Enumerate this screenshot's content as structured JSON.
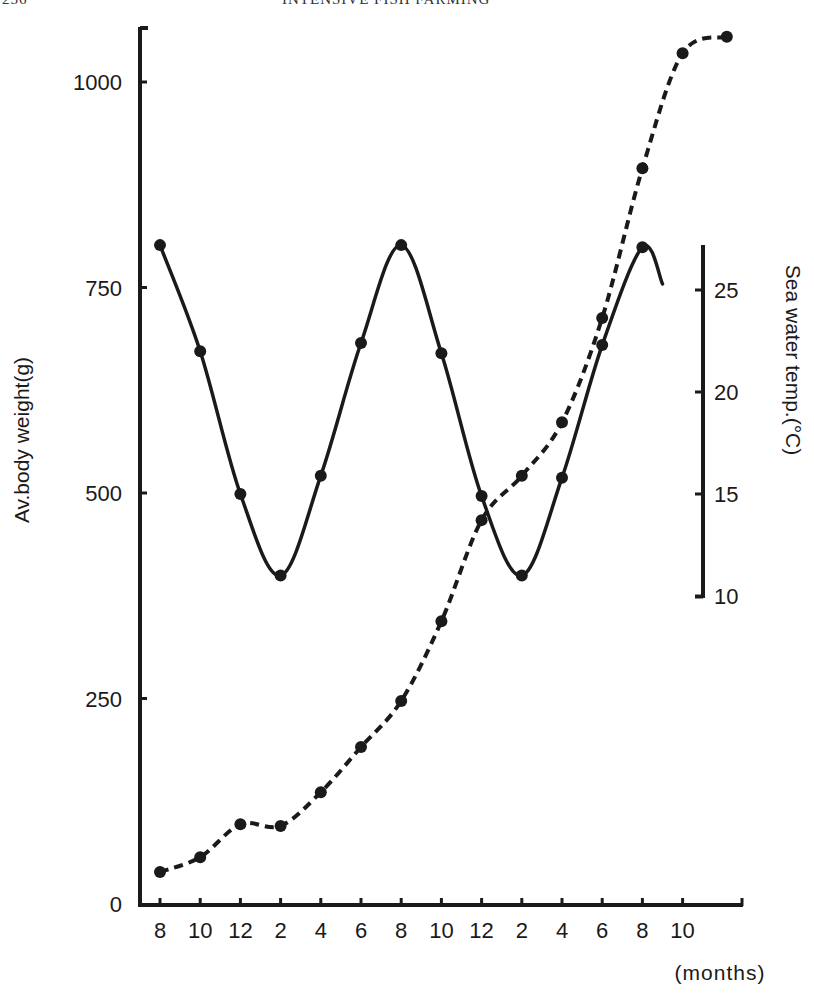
{
  "page": {
    "number": "256",
    "running_title": "INTENSIVE FISH FARMING"
  },
  "chart_data": {
    "type": "line",
    "title": "",
    "xlabel": "(months)",
    "ylabel": "Av.body weight(g)",
    "y2label": "Sea water temp.(°C)",
    "x_tick_labels": [
      "8",
      "10",
      "12",
      "2",
      "4",
      "6",
      "8",
      "10",
      "12",
      "2",
      "4",
      "6",
      "8",
      "10"
    ],
    "y_ticks": [
      0,
      250,
      500,
      750,
      1000
    ],
    "y_tick_labels": [
      "0",
      "250",
      "500",
      "750",
      "1000"
    ],
    "ylim": [
      0,
      1070
    ],
    "y2_ticks": [
      10,
      15,
      20,
      25
    ],
    "y2_tick_labels": [
      "10",
      "15",
      "20",
      "25"
    ],
    "y2lim": [
      10,
      27
    ],
    "grid": false,
    "legend": "none",
    "series": [
      {
        "name": "Av. body weight (g)",
        "axis": "left",
        "style": "dashed",
        "x_index": [
          0,
          1,
          2,
          3,
          4,
          5,
          6,
          7,
          8,
          9,
          10,
          11,
          12,
          13,
          14.1
        ],
        "values": [
          39,
          57,
          97,
          95,
          136,
          191,
          247,
          344,
          467,
          521,
          586,
          713,
          895,
          1035,
          1055
        ]
      },
      {
        "name": "Sea water temp. (°C)",
        "axis": "right",
        "style": "solid",
        "x_index": [
          0,
          1,
          2,
          3,
          4,
          5,
          6,
          7,
          8,
          9,
          10,
          11,
          12
        ],
        "values": [
          27.2,
          22.0,
          15.0,
          11.0,
          15.9,
          22.4,
          27.2,
          21.9,
          14.9,
          11.0,
          15.8,
          22.3,
          27.1
        ],
        "curve_end": {
          "x_index": 12.5,
          "value": 25.3
        }
      }
    ]
  }
}
